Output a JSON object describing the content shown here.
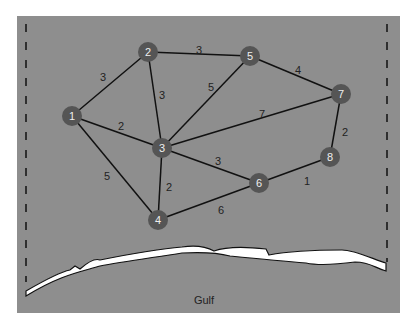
{
  "diagram": {
    "type": "weighted-graph-map",
    "colors": {
      "background": "#8e8e8e",
      "node": "#555555",
      "edge": "#111111",
      "coast": "#ffffff"
    },
    "nodes": [
      {
        "id": "1",
        "x": 72,
        "y": 116
      },
      {
        "id": "2",
        "x": 148,
        "y": 52
      },
      {
        "id": "3",
        "x": 162,
        "y": 148
      },
      {
        "id": "4",
        "x": 158,
        "y": 220
      },
      {
        "id": "5",
        "x": 250,
        "y": 56
      },
      {
        "id": "6",
        "x": 259,
        "y": 183
      },
      {
        "id": "7",
        "x": 341,
        "y": 94
      },
      {
        "id": "8",
        "x": 330,
        "y": 157
      }
    ],
    "edges": [
      {
        "from": "1",
        "to": "2",
        "weight": "3",
        "lx": 103,
        "ly": 77
      },
      {
        "from": "2",
        "to": "5",
        "weight": "3",
        "lx": 199,
        "ly": 50
      },
      {
        "from": "2",
        "to": "3",
        "weight": "3",
        "lx": 162,
        "ly": 95
      },
      {
        "from": "3",
        "to": "5",
        "weight": "5",
        "lx": 211,
        "ly": 87
      },
      {
        "from": "1",
        "to": "3",
        "weight": "2",
        "lx": 121,
        "ly": 126
      },
      {
        "from": "5",
        "to": "7",
        "weight": "4",
        "lx": 298,
        "ly": 70
      },
      {
        "from": "3",
        "to": "7",
        "weight": "7",
        "lx": 262,
        "ly": 114
      },
      {
        "from": "7",
        "to": "8",
        "weight": "2",
        "lx": 345,
        "ly": 132
      },
      {
        "from": "3",
        "to": "6",
        "weight": "3",
        "lx": 218,
        "ly": 161
      },
      {
        "from": "1",
        "to": "4",
        "weight": "5",
        "lx": 107,
        "ly": 176
      },
      {
        "from": "3",
        "to": "4",
        "weight": "2",
        "lx": 169,
        "ly": 187
      },
      {
        "from": "4",
        "to": "6",
        "weight": "6",
        "lx": 221,
        "ly": 210
      },
      {
        "from": "6",
        "to": "8",
        "weight": "1",
        "lx": 307,
        "ly": 181
      }
    ],
    "water_label": "Gulf"
  }
}
